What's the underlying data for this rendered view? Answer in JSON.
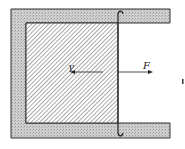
{
  "diagram": {
    "title": "",
    "labels": {
      "gamma": "γ",
      "force": "F"
    },
    "elements": [
      {
        "name": "u-frame",
        "description": "U-shaped wire frame (stippled gray)"
      },
      {
        "name": "soap-film",
        "description": "hatched film region inside frame"
      },
      {
        "name": "sliding-wire",
        "description": "movable wire with curled ends"
      },
      {
        "name": "gamma-arrow",
        "description": "surface tension arrow pointing left"
      },
      {
        "name": "force-arrow",
        "description": "applied force arrow pointing right"
      }
    ],
    "colors": {
      "frame_fill": "#c8c8c8",
      "outline": "#333333",
      "hatch": "#555555"
    }
  }
}
